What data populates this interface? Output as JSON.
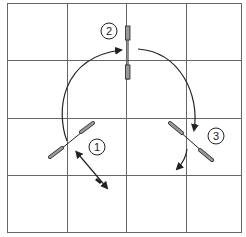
{
  "diagram": {
    "grid": {
      "cols": 4,
      "rows": 4,
      "line_color": "#666666",
      "background": "#ffffff"
    },
    "positions": [
      {
        "label": "1"
      },
      {
        "label": "2"
      },
      {
        "label": "3"
      }
    ],
    "colors": {
      "stroke": "#222222",
      "marker_fill": "#999999"
    }
  }
}
